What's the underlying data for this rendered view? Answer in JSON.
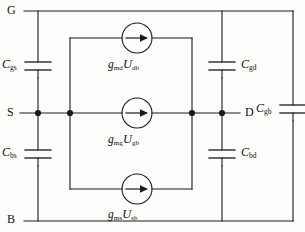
{
  "figure": {
    "kind": "circuit-schematic",
    "line_color": "#1a1a1a",
    "background_color": "#fdfdfb",
    "text_color": "#111111"
  },
  "terminals": [
    {
      "id": "gate",
      "label": "G",
      "position": "top-left"
    },
    {
      "id": "source",
      "label": "S",
      "position": "middle-left"
    },
    {
      "id": "drain",
      "label": "D",
      "position": "middle-right"
    },
    {
      "id": "bulk",
      "label": "B",
      "position": "bottom-left"
    }
  ],
  "capacitors": [
    {
      "id": "cgs",
      "symbol": "C",
      "subscript": "gs",
      "between": "G-S",
      "label_side": "left"
    },
    {
      "id": "cbs",
      "symbol": "C",
      "subscript": "bs",
      "between": "S-B",
      "label_side": "left"
    },
    {
      "id": "cgd",
      "symbol": "C",
      "subscript": "gd",
      "between": "G-D",
      "label_side": "right"
    },
    {
      "id": "cbd",
      "symbol": "C",
      "subscript": "bd",
      "between": "D-B",
      "label_side": "right"
    },
    {
      "id": "cgb",
      "symbol": "C",
      "subscript": "gb",
      "between": "G-B",
      "label_side": "left"
    }
  ],
  "current_sources": [
    {
      "id": "src-md",
      "gm_symbol": "g",
      "gm_subscript": "md",
      "u_symbol": "U",
      "u_subscript": "db",
      "arrow_direction": "right",
      "row": "top"
    },
    {
      "id": "src-mg",
      "gm_symbol": "g",
      "gm_subscript": "mg",
      "u_symbol": "U",
      "u_subscript": "gb",
      "arrow_direction": "right",
      "row": "middle"
    },
    {
      "id": "src-ms",
      "gm_symbol": "g",
      "gm_subscript": "ms",
      "u_symbol": "U",
      "u_subscript": "sb",
      "arrow_direction": "right",
      "row": "bottom"
    }
  ],
  "nodes": [
    {
      "id": "node-s-left",
      "x": 38,
      "y": 113
    },
    {
      "id": "node-s-mid",
      "x": 70,
      "y": 113
    },
    {
      "id": "node-d-inner",
      "x": 192,
      "y": 113
    },
    {
      "id": "node-d-right",
      "x": 222,
      "y": 113
    }
  ]
}
